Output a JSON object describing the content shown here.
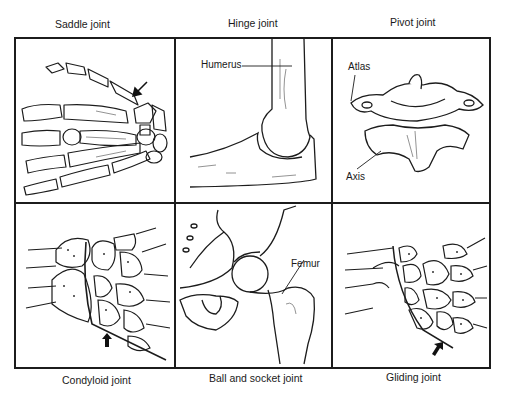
{
  "figure": {
    "panels": [
      {
        "id": "saddle",
        "caption": "Saddle joint",
        "position": "top-left",
        "labels": [],
        "has_arrow": true
      },
      {
        "id": "hinge",
        "caption": "Hinge joint",
        "position": "top-center",
        "labels": [
          "Humerus"
        ],
        "has_arrow": false
      },
      {
        "id": "pivot",
        "caption": "Pivot joint",
        "position": "top-right",
        "labels": [
          "Atlas",
          "Axis"
        ],
        "has_arrow": false
      },
      {
        "id": "condyloid",
        "caption": "Condyloid joint",
        "position": "bottom-left",
        "labels": [],
        "has_arrow": true
      },
      {
        "id": "ballsocket",
        "caption": "Ball and socket joint",
        "position": "bottom-center",
        "labels": [
          "Femur"
        ],
        "has_arrow": false
      },
      {
        "id": "gliding",
        "caption": "Gliding joint",
        "position": "bottom-right",
        "labels": [],
        "has_arrow": true
      }
    ],
    "colors": {
      "line": "#1c1c1c",
      "background": "#ffffff",
      "shading": "#777777"
    }
  }
}
